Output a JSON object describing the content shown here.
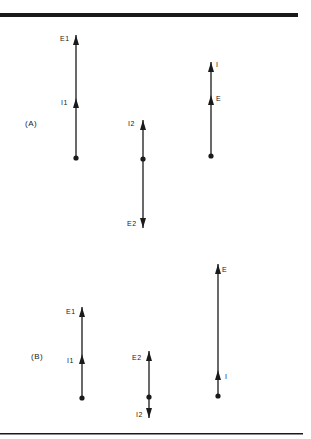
{
  "figure": {
    "colors": {
      "ink": "#1a1a1a",
      "background": "#ffffff"
    },
    "panels": [
      {
        "label": "(A)",
        "phasors": [
          {
            "id": "a-left",
            "vectors": [
              {
                "name": "E1",
                "direction": "up"
              },
              {
                "name": "I1",
                "direction": "up"
              }
            ]
          },
          {
            "id": "a-mid",
            "vectors": [
              {
                "name": "I2",
                "direction": "up"
              },
              {
                "name": "E2",
                "direction": "down"
              }
            ]
          },
          {
            "id": "a-right",
            "vectors": [
              {
                "name": "I",
                "direction": "up"
              },
              {
                "name": "E",
                "direction": "up"
              }
            ]
          }
        ]
      },
      {
        "label": "(B)",
        "phasors": [
          {
            "id": "b-left",
            "vectors": [
              {
                "name": "E1",
                "direction": "up"
              },
              {
                "name": "I1",
                "direction": "up"
              }
            ]
          },
          {
            "id": "b-mid",
            "vectors": [
              {
                "name": "E2",
                "direction": "up"
              },
              {
                "name": "I2",
                "direction": "down"
              }
            ]
          },
          {
            "id": "b-right",
            "vectors": [
              {
                "name": "E",
                "direction": "up"
              },
              {
                "name": "I",
                "direction": "up"
              }
            ]
          }
        ]
      }
    ]
  }
}
